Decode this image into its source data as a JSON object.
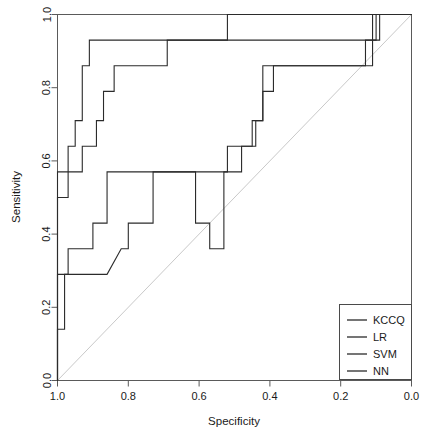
{
  "chart_data": {
    "type": "line",
    "title": "",
    "xlabel": "Specificity",
    "ylabel": "Sensitivity",
    "xlim": [
      1.0,
      0.0
    ],
    "ylim": [
      0.0,
      1.0
    ],
    "x_reversed": true,
    "grid": false,
    "legend_position": "bottom-right",
    "xticks": [
      "1.0",
      "0.8",
      "0.6",
      "0.4",
      "0.2",
      "0.0"
    ],
    "xtick_values": [
      1.0,
      0.8,
      0.6,
      0.4,
      0.2,
      0.0
    ],
    "yticks": [
      "0.0",
      "0.2",
      "0.4",
      "0.6",
      "0.8",
      "1.0"
    ],
    "ytick_values": [
      0.0,
      0.2,
      0.4,
      0.6,
      0.8,
      1.0
    ],
    "reference_line": {
      "name": "chance-diagonal",
      "from": [
        1.0,
        0.0
      ],
      "to": [
        0.0,
        1.0
      ],
      "color": "#c9c9c9"
    },
    "series": [
      {
        "name": "KCCQ",
        "color": "#2b2b2b",
        "points": [
          [
            1.0,
            0.0
          ],
          [
            1.0,
            0.5
          ],
          [
            0.97,
            0.5
          ],
          [
            0.97,
            0.64
          ],
          [
            0.95,
            0.64
          ],
          [
            0.95,
            0.71
          ],
          [
            0.93,
            0.71
          ],
          [
            0.93,
            0.86
          ],
          [
            0.91,
            0.86
          ],
          [
            0.91,
            0.93
          ],
          [
            0.52,
            0.93
          ],
          [
            0.52,
            1.0
          ],
          [
            0.0,
            1.0
          ]
        ]
      },
      {
        "name": "LR",
        "color": "#2b2b2b",
        "points": [
          [
            1.0,
            0.0
          ],
          [
            1.0,
            0.29
          ],
          [
            0.97,
            0.29
          ],
          [
            0.97,
            0.36
          ],
          [
            0.9,
            0.36
          ],
          [
            0.9,
            0.43
          ],
          [
            0.86,
            0.43
          ],
          [
            0.86,
            0.57
          ],
          [
            0.61,
            0.57
          ],
          [
            0.61,
            0.43
          ],
          [
            0.57,
            0.43
          ],
          [
            0.57,
            0.36
          ],
          [
            0.53,
            0.36
          ],
          [
            0.53,
            0.57
          ],
          [
            0.48,
            0.57
          ],
          [
            0.48,
            0.64
          ],
          [
            0.44,
            0.64
          ],
          [
            0.44,
            0.71
          ],
          [
            0.42,
            0.71
          ],
          [
            0.42,
            0.79
          ],
          [
            0.39,
            0.79
          ],
          [
            0.39,
            0.86
          ],
          [
            0.13,
            0.86
          ],
          [
            0.13,
            0.93
          ],
          [
            0.09,
            0.93
          ],
          [
            0.09,
            1.0
          ],
          [
            0.0,
            1.0
          ]
        ]
      },
      {
        "name": "SVM",
        "color": "#2b2b2b",
        "points": [
          [
            1.0,
            0.0
          ],
          [
            1.0,
            0.14
          ],
          [
            0.98,
            0.14
          ],
          [
            0.98,
            0.29
          ],
          [
            0.86,
            0.29
          ],
          [
            0.82,
            0.36
          ],
          [
            0.8,
            0.36
          ],
          [
            0.8,
            0.43
          ],
          [
            0.73,
            0.43
          ],
          [
            0.73,
            0.57
          ],
          [
            0.52,
            0.57
          ],
          [
            0.52,
            0.64
          ],
          [
            0.45,
            0.64
          ],
          [
            0.45,
            0.71
          ],
          [
            0.42,
            0.71
          ],
          [
            0.42,
            0.86
          ],
          [
            0.11,
            0.86
          ],
          [
            0.11,
            1.0
          ],
          [
            0.0,
            1.0
          ]
        ]
      },
      {
        "name": "NN",
        "color": "#2b2b2b",
        "points": [
          [
            1.0,
            0.0
          ],
          [
            1.0,
            0.57
          ],
          [
            0.93,
            0.57
          ],
          [
            0.93,
            0.64
          ],
          [
            0.89,
            0.64
          ],
          [
            0.89,
            0.71
          ],
          [
            0.87,
            0.71
          ],
          [
            0.87,
            0.79
          ],
          [
            0.84,
            0.79
          ],
          [
            0.84,
            0.86
          ],
          [
            0.69,
            0.86
          ],
          [
            0.69,
            0.93
          ],
          [
            0.1,
            0.93
          ],
          [
            0.1,
            1.0
          ],
          [
            0.0,
            1.0
          ]
        ]
      }
    ],
    "legend_entries": [
      "KCCQ",
      "LR",
      "SVM",
      "NN"
    ]
  },
  "axes": {
    "x_title": "Specificity",
    "y_title": "Sensitivity"
  },
  "legend": {
    "items": [
      {
        "label": "KCCQ"
      },
      {
        "label": "LR"
      },
      {
        "label": "SVM"
      },
      {
        "label": "NN"
      }
    ]
  }
}
